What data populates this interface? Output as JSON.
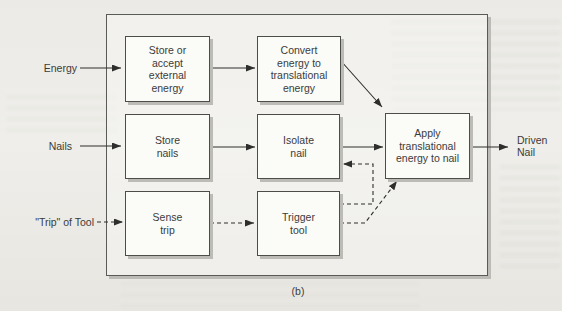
{
  "figure": {
    "caption": "(b)",
    "inputs": [
      {
        "id": "energy",
        "label": "Energy"
      },
      {
        "id": "nails",
        "label": "Nails"
      },
      {
        "id": "trip",
        "label": "\"Trip\" of Tool"
      }
    ],
    "output": {
      "id": "driven-nail",
      "label": "Driven\nNail"
    },
    "boxes": [
      {
        "id": "store-energy",
        "label": "Store or\naccept\nexternal\nenergy"
      },
      {
        "id": "convert-energy",
        "label": "Convert\nenergy to\ntranslational\nenergy"
      },
      {
        "id": "store-nails",
        "label": "Store\nnails"
      },
      {
        "id": "isolate-nail",
        "label": "Isolate\nnail"
      },
      {
        "id": "apply-energy",
        "label": "Apply\ntranslational\nenergy to nail"
      },
      {
        "id": "sense-trip",
        "label": "Sense\ntrip"
      },
      {
        "id": "trigger-tool",
        "label": "Trigger\ntool"
      }
    ],
    "connections": [
      {
        "from": "energy-input",
        "to": "store-energy",
        "style": "solid"
      },
      {
        "from": "store-energy",
        "to": "convert-energy",
        "style": "solid"
      },
      {
        "from": "convert-energy",
        "to": "apply-energy",
        "style": "solid"
      },
      {
        "from": "nails-input",
        "to": "store-nails",
        "style": "solid"
      },
      {
        "from": "store-nails",
        "to": "isolate-nail",
        "style": "solid"
      },
      {
        "from": "isolate-nail",
        "to": "apply-energy",
        "style": "solid"
      },
      {
        "from": "apply-energy",
        "to": "driven-nail-output",
        "style": "solid"
      },
      {
        "from": "trip-input",
        "to": "sense-trip",
        "style": "dashed"
      },
      {
        "from": "sense-trip",
        "to": "trigger-tool",
        "style": "dashed"
      },
      {
        "from": "trigger-tool",
        "to": "isolate-nail",
        "style": "dashed"
      },
      {
        "from": "trigger-tool",
        "to": "apply-energy",
        "style": "dashed"
      }
    ],
    "colors": {
      "background": "#eceae6",
      "box_fill": "#fbfbf8",
      "box_border": "#4c4c4a",
      "shadow": "#bdbbb6",
      "arrow": "#2e2e2c",
      "text": "#3b3b3b"
    }
  }
}
